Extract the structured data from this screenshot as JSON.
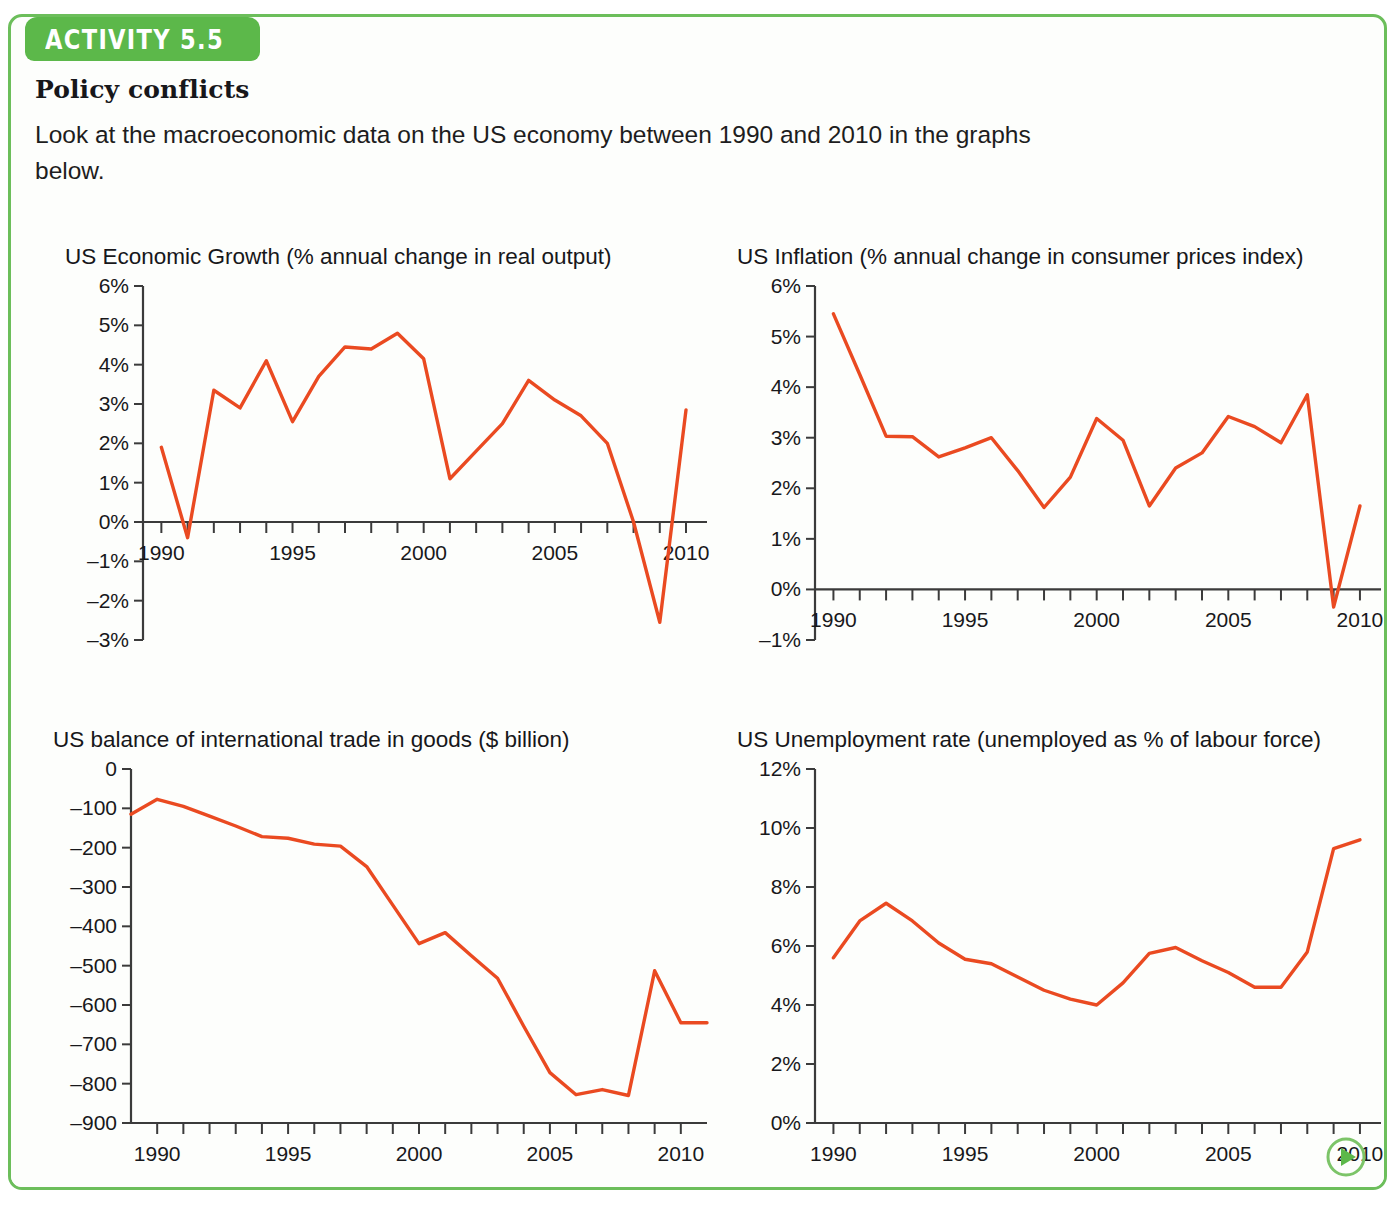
{
  "activity": {
    "tab_label": "ACTIVITY 5.5",
    "title": "Policy conflicts",
    "intro": "Look at the macroeconomic data on the US economy between 1990 and 2010 in the graphs below."
  },
  "colors": {
    "brand_green": "#5cb84a",
    "border_green": "#6cbe5b",
    "series_orange": "#ea4a21",
    "axis_black": "#3b3b3b",
    "card_background": "#fdfefc"
  },
  "next_button": {
    "icon": "play-triangle-icon",
    "label": "Next"
  },
  "chart_data": [
    {
      "id": "growth",
      "type": "line",
      "title": "US Economic Growth (% annual change in real output)",
      "xlabel": "",
      "ylabel": "",
      "xlim": [
        1989.3,
        2010.8
      ],
      "ylim": [
        -3,
        6
      ],
      "ytick_step": 1,
      "ytick_labels": [
        "6%",
        "5%",
        "4%",
        "3%",
        "2%",
        "1%",
        "0%",
        "–1%",
        "–2%",
        "–3%"
      ],
      "ytick_values": [
        6,
        5,
        4,
        3,
        2,
        1,
        0,
        -1,
        -2,
        -3
      ],
      "xtick_values": [
        1990,
        1991,
        1992,
        1993,
        1994,
        1995,
        1996,
        1997,
        1998,
        1999,
        2000,
        2001,
        2002,
        2003,
        2004,
        2005,
        2006,
        2007,
        2008,
        2009,
        2010
      ],
      "xtick_labels": [
        "1990",
        "1995",
        "2000",
        "2005",
        "2010"
      ],
      "xtick_label_values": [
        1990,
        1995,
        2000,
        2005,
        2010
      ],
      "x": [
        1990,
        1991,
        1992,
        1993,
        1994,
        1995,
        1996,
        1997,
        1998,
        1999,
        2000,
        2001,
        2002,
        2003,
        2004,
        2005,
        2006,
        2007,
        2008,
        2009,
        2010
      ],
      "values": [
        1.9,
        -0.4,
        3.35,
        2.9,
        4.1,
        2.55,
        3.7,
        4.45,
        4.4,
        4.8,
        4.15,
        1.1,
        1.8,
        2.5,
        3.6,
        3.1,
        2.7,
        2.0,
        0.0,
        -2.55,
        2.85
      ],
      "grid": false,
      "legend": "none",
      "axis_zero_line": true
    },
    {
      "id": "inflation",
      "type": "line",
      "title": "US Inflation (% annual change in consumer prices index)",
      "xlabel": "",
      "ylabel": "",
      "xlim": [
        1989.3,
        2010.8
      ],
      "ylim": [
        -1,
        6
      ],
      "ytick_step": 1,
      "ytick_labels": [
        "6%",
        "5%",
        "4%",
        "3%",
        "2%",
        "1%",
        "0%",
        "–1%"
      ],
      "ytick_values": [
        6,
        5,
        4,
        3,
        2,
        1,
        0,
        -1
      ],
      "xtick_values": [
        1990,
        1991,
        1992,
        1993,
        1994,
        1995,
        1996,
        1997,
        1998,
        1999,
        2000,
        2001,
        2002,
        2003,
        2004,
        2005,
        2006,
        2007,
        2008,
        2009,
        2010
      ],
      "xtick_labels": [
        "1990",
        "1995",
        "2000",
        "2005",
        "2010"
      ],
      "xtick_label_values": [
        1990,
        1995,
        2000,
        2005,
        2010
      ],
      "x": [
        1990,
        1991,
        1992,
        1993,
        1994,
        1995,
        1996,
        1997,
        1998,
        1999,
        2000,
        2001,
        2002,
        2003,
        2004,
        2005,
        2006,
        2007,
        2008,
        2009,
        2010
      ],
      "values": [
        5.45,
        4.25,
        3.03,
        3.02,
        2.62,
        2.8,
        3.0,
        2.35,
        1.62,
        2.22,
        3.38,
        2.95,
        1.65,
        2.4,
        2.7,
        3.42,
        3.22,
        2.9,
        3.85,
        -0.35,
        1.65
      ],
      "grid": false,
      "legend": "none",
      "axis_zero_line": true
    },
    {
      "id": "trade",
      "type": "line",
      "title": "US balance of international trade in goods ($ billion)",
      "xlabel": "",
      "ylabel": "",
      "xlim": [
        1989.0,
        2011.0
      ],
      "ylim": [
        -900,
        0
      ],
      "ytick_step": 100,
      "ytick_labels": [
        "0",
        "–100",
        "–200",
        "–300",
        "–400",
        "–500",
        "–600",
        "–700",
        "–800",
        "–900"
      ],
      "ytick_values": [
        0,
        -100,
        -200,
        -300,
        -400,
        -500,
        -600,
        -700,
        -800,
        -900
      ],
      "xtick_values": [
        1990,
        1991,
        1992,
        1993,
        1994,
        1995,
        1996,
        1997,
        1998,
        1999,
        2000,
        2001,
        2002,
        2003,
        2004,
        2005,
        2006,
        2007,
        2008,
        2009,
        2010
      ],
      "xtick_labels": [
        "1990",
        "1995",
        "2000",
        "2005",
        "2010"
      ],
      "xtick_label_values": [
        1990,
        1995,
        2000,
        2005,
        2010
      ],
      "x": [
        1989,
        1990,
        1991,
        1992,
        1993,
        1994,
        1995,
        1996,
        1997,
        1998,
        1999,
        2000,
        2001,
        2002,
        2003,
        2004,
        2005,
        2006,
        2007,
        2008,
        2009,
        2010,
        2011
      ],
      "values": [
        -115,
        -77,
        -95,
        -120,
        -145,
        -172,
        -176,
        -191,
        -196,
        -248,
        -346,
        -444,
        -416,
        -475,
        -532,
        -654,
        -772,
        -828,
        -815,
        -830,
        -513,
        -645,
        -645
      ],
      "grid": false,
      "legend": "none",
      "axis_zero_line": false
    },
    {
      "id": "unemployment",
      "type": "line",
      "title": "US Unemployment rate (unemployed as % of labour force)",
      "xlabel": "",
      "ylabel": "",
      "xlim": [
        1989.3,
        2010.8
      ],
      "ylim": [
        0,
        12
      ],
      "ytick_step": 2,
      "ytick_labels": [
        "12%",
        "10%",
        "8%",
        "6%",
        "4%",
        "2%",
        "0%"
      ],
      "ytick_values": [
        12,
        10,
        8,
        6,
        4,
        2,
        0
      ],
      "xtick_values": [
        1990,
        1991,
        1992,
        1993,
        1994,
        1995,
        1996,
        1997,
        1998,
        1999,
        2000,
        2001,
        2002,
        2003,
        2004,
        2005,
        2006,
        2007,
        2008,
        2009,
        2010
      ],
      "xtick_labels": [
        "1990",
        "1995",
        "2000",
        "2005",
        "2010"
      ],
      "xtick_label_values": [
        1990,
        1995,
        2000,
        2005,
        2010
      ],
      "x": [
        1990,
        1991,
        1992,
        1993,
        1994,
        1995,
        1996,
        1997,
        1998,
        1999,
        2000,
        2001,
        2002,
        2003,
        2004,
        2005,
        2006,
        2007,
        2008,
        2009,
        2010
      ],
      "values": [
        5.6,
        6.85,
        7.45,
        6.85,
        6.1,
        5.55,
        5.4,
        4.95,
        4.5,
        4.2,
        4.0,
        4.75,
        5.75,
        5.95,
        5.5,
        5.1,
        4.6,
        4.6,
        5.8,
        9.3,
        9.6
      ],
      "grid": false,
      "legend": "none",
      "axis_zero_line": false
    }
  ]
}
